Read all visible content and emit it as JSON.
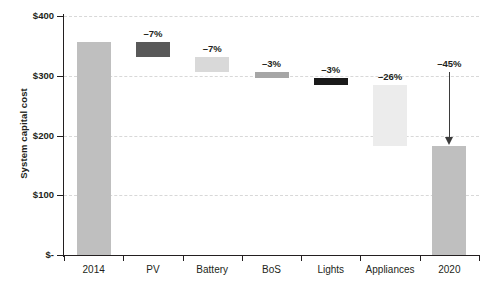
{
  "chart_data": {
    "type": "bar",
    "subtype": "waterfall",
    "title": "",
    "xlabel": "",
    "ylabel": "System capital cost",
    "ylim": [
      0,
      400
    ],
    "grid": true,
    "legend": "none",
    "y_ticks": [
      {
        "value": 400,
        "label": "$400"
      },
      {
        "value": 300,
        "label": "$300"
      },
      {
        "value": 200,
        "label": "$200"
      },
      {
        "value": 100,
        "label": "$100"
      },
      {
        "value": 0,
        "label": "$-"
      }
    ],
    "categories": [
      "2014",
      "PV",
      "Battery",
      "BoS",
      "Lights",
      "Appliances",
      "2020"
    ],
    "annotations": [
      "",
      "–7%",
      "–7%",
      "–3%",
      "–3%",
      "–26%",
      "–45%"
    ],
    "values": [
      357,
      -25,
      -25,
      -11,
      -11,
      -102,
      183
    ],
    "bars": [
      {
        "category": "2014",
        "kind": "total",
        "label": "",
        "start": 0,
        "end": 357,
        "color": "#bfbfbf"
      },
      {
        "category": "PV",
        "kind": "delta",
        "label": "–7%",
        "start": 332,
        "end": 357,
        "color": "#595959"
      },
      {
        "category": "Battery",
        "kind": "delta",
        "label": "–7%",
        "start": 307,
        "end": 332,
        "color": "#d9d9d9"
      },
      {
        "category": "BoS",
        "kind": "delta",
        "label": "–3%",
        "start": 296,
        "end": 307,
        "color": "#a6a6a6"
      },
      {
        "category": "Lights",
        "kind": "delta",
        "label": "–3%",
        "start": 285,
        "end": 296,
        "color": "#1a1a1a"
      },
      {
        "category": "Appliances",
        "kind": "delta",
        "label": "–26%",
        "start": 183,
        "end": 285,
        "color": "#ececec"
      },
      {
        "category": "2020",
        "kind": "total",
        "label": "",
        "start": 0,
        "end": 183,
        "color": "#bfbfbf"
      }
    ],
    "arrow": {
      "label": "–45%",
      "from": 307,
      "to": 186,
      "category": "2020"
    },
    "colors": {
      "bar_total": "#bfbfbf",
      "bar_dark": "#595959",
      "bar_darkest": "#1a1a1a",
      "bar_light": "#d9d9d9",
      "bar_lightest": "#ececec",
      "bar_mid": "#a6a6a6",
      "grid": "#d8d8d8",
      "axis": "#231f20",
      "arrow": "#3b3b3b",
      "background": "#ffffff"
    }
  }
}
